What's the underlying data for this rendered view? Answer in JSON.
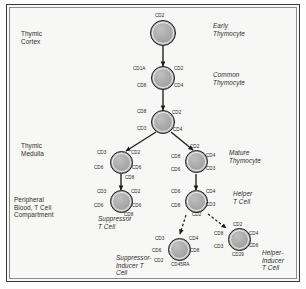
{
  "diagram": {
    "stages": [
      {
        "id": "thymic-cortex",
        "label": "Thymic\nCortex"
      },
      {
        "id": "thymic-medulla",
        "label": "Thymic\nMedulla"
      },
      {
        "id": "peripheral-blood",
        "label": "Peripheral\nBlood, T Cell\nCompartment"
      }
    ],
    "cell_types": [
      {
        "id": "early-thymocyte",
        "label": "Early\nThymocyte"
      },
      {
        "id": "common-thymocyte",
        "label": "Common\nThymocyte"
      },
      {
        "id": "mature-thymocyte",
        "label": "Mature\nThymocyte"
      },
      {
        "id": "helper-t-cell",
        "label": "Helper\nT Cell"
      },
      {
        "id": "suppressor-t-cell",
        "label": "Suppressor\nT Cell"
      },
      {
        "id": "suppressor-inducer-t-cell",
        "label": "Suppressor-\nInducer T\nCell"
      },
      {
        "id": "helper-inducer-t-cell",
        "label": "Helper-\nInducer\nT Cell"
      }
    ],
    "cells": [
      {
        "id": "cell-early-thymocyte",
        "markers": [
          {
            "text": "CD2",
            "pos": "top"
          }
        ]
      },
      {
        "id": "cell-common-thymocyte",
        "markers": [
          {
            "text": "CD1A",
            "pos": "top-left"
          },
          {
            "text": "CD2",
            "pos": "top-right"
          },
          {
            "text": "CD8",
            "pos": "bottom-left"
          },
          {
            "text": "CD4",
            "pos": "bottom-right"
          }
        ]
      },
      {
        "id": "cell-transitional-thymocyte",
        "markers": [
          {
            "text": "CD8",
            "pos": "top-left"
          },
          {
            "text": "CD2",
            "pos": "top-right"
          },
          {
            "text": "CD3",
            "pos": "bottom-left"
          },
          {
            "text": "CD4",
            "pos": "bottom-right"
          }
        ]
      },
      {
        "id": "cell-suppressor-precursor",
        "markers": [
          {
            "text": "CD3",
            "pos": "top-left"
          },
          {
            "text": "CD2",
            "pos": "top-right"
          },
          {
            "text": "CD6",
            "pos": "mid-left"
          },
          {
            "text": "CD6",
            "pos": "mid-right"
          },
          {
            "text": "CD8",
            "pos": "bottom"
          }
        ]
      },
      {
        "id": "cell-mature-thymocyte",
        "markers": [
          {
            "text": "CD2",
            "pos": "top"
          },
          {
            "text": "CD8",
            "pos": "mid-left"
          },
          {
            "text": "CD4",
            "pos": "top-right"
          },
          {
            "text": "CD6",
            "pos": "bottom-left"
          },
          {
            "text": "CD3",
            "pos": "bottom-right"
          }
        ]
      },
      {
        "id": "cell-suppressor-t-cell",
        "markers": [
          {
            "text": "CD3",
            "pos": "top-left"
          },
          {
            "text": "CD2",
            "pos": "top-right"
          },
          {
            "text": "CD6",
            "pos": "mid-left"
          },
          {
            "text": "CD6",
            "pos": "mid-right"
          },
          {
            "text": "CD8",
            "pos": "bottom"
          }
        ]
      },
      {
        "id": "cell-helper-t-cell",
        "markers": [
          {
            "text": "CD6",
            "pos": "top-left"
          },
          {
            "text": "CD4",
            "pos": "top-right"
          },
          {
            "text": "CD8",
            "pos": "mid-left"
          },
          {
            "text": "CD3",
            "pos": "mid-right"
          },
          {
            "text": "CD2",
            "pos": "bottom"
          }
        ]
      },
      {
        "id": "cell-suppressor-inducer-t-cell",
        "markers": [
          {
            "text": "CD3",
            "pos": "top-left"
          },
          {
            "text": "CD4",
            "pos": "top-right"
          },
          {
            "text": "CD6",
            "pos": "mid-left"
          },
          {
            "text": "CD8",
            "pos": "mid-right"
          },
          {
            "text": "CD2",
            "pos": "bottom-left"
          },
          {
            "text": "CD45RA",
            "pos": "bottom"
          }
        ]
      },
      {
        "id": "cell-helper-inducer-t-cell",
        "markers": [
          {
            "text": "CD2",
            "pos": "top"
          },
          {
            "text": "CD8",
            "pos": "mid-left"
          },
          {
            "text": "CD4",
            "pos": "top-right"
          },
          {
            "text": "CD3",
            "pos": "bottom-left"
          },
          {
            "text": "CD6",
            "pos": "bottom-right"
          },
          {
            "text": "CD29",
            "pos": "bottom"
          }
        ]
      }
    ]
  },
  "colors": {
    "cell_fill": "#a9a9a9",
    "cell_stroke": "#1d1d1d",
    "frame_stroke": "#3a3a3a",
    "background": "#f7f7f5",
    "text": "#2c2c2c"
  }
}
